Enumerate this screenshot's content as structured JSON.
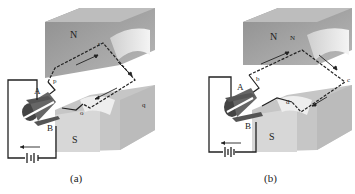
{
  "figure": {
    "panels": [
      {
        "id": "a",
        "caption": "(a)",
        "magnet_top_label": "N",
        "magnet_bottom_label": "S",
        "brush_top_label": "A",
        "brush_bottom_label": "B",
        "coil_corner_labels": [
          "p",
          "r",
          "q",
          "o"
        ]
      },
      {
        "id": "b",
        "caption": "(b)",
        "magnet_top_label": "N",
        "magnet_bottom_label": "S",
        "brush_top_label": "A",
        "brush_bottom_label": "B",
        "coil_corner_labels": [
          "b",
          "N",
          "c",
          "d"
        ]
      }
    ],
    "colors": {
      "magnet_face": "#9a9a9a",
      "magnet_top": "#c8c8c8",
      "magnet_side": "#b5b5b5",
      "pole_curve": "#e8e8e8",
      "wire": "#222222",
      "commutator": "#555555"
    }
  }
}
